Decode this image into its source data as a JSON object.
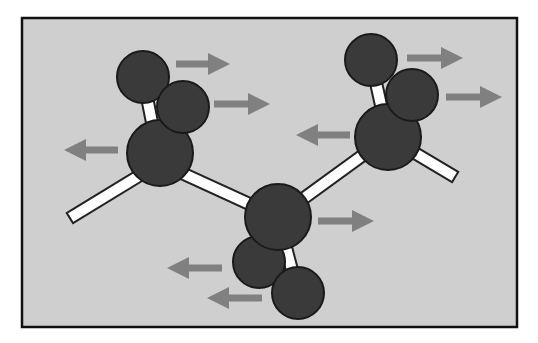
{
  "diagram": {
    "type": "ball-and-stick molecule with motion arrows",
    "colors": {
      "page_background": "#ffffff",
      "panel_background": "#cfcfcf",
      "panel_border": "#111111",
      "atom_fill": "#3a3a3a",
      "atom_stroke": "#1a1a1a",
      "bond_fill": "#ffffff",
      "bond_stroke": "#222222",
      "arrow_color": "#808080"
    },
    "frame": {
      "x": 22,
      "y": 18,
      "width": 495,
      "height": 309
    },
    "bonds": [
      {
        "x1": 75,
        "y1": 215,
        "x2": 160,
        "y2": 163
      },
      {
        "x1": 160,
        "y1": 163,
        "x2": 278,
        "y2": 217
      },
      {
        "x1": 278,
        "y1": 217,
        "x2": 388,
        "y2": 137
      },
      {
        "x1": 388,
        "y1": 137,
        "x2": 450,
        "y2": 174
      },
      {
        "x1": 160,
        "y1": 163,
        "x2": 143,
        "y2": 77
      },
      {
        "x1": 160,
        "y1": 163,
        "x2": 183,
        "y2": 107
      },
      {
        "x1": 388,
        "y1": 137,
        "x2": 371,
        "y2": 60
      },
      {
        "x1": 388,
        "y1": 137,
        "x2": 412,
        "y2": 95
      },
      {
        "x1": 278,
        "y1": 217,
        "x2": 298,
        "y2": 293
      },
      {
        "x1": 278,
        "y1": 217,
        "x2": 259,
        "y2": 262
      }
    ],
    "atoms": [
      {
        "name": "hydrogen-top-left-a",
        "cx": 143,
        "cy": 77,
        "r": 26
      },
      {
        "name": "hydrogen-top-right-a",
        "cx": 371,
        "cy": 60,
        "r": 26
      },
      {
        "name": "hydrogen-bottom-a",
        "cx": 259,
        "cy": 262,
        "r": 26
      },
      {
        "name": "carbon-left",
        "cx": 160,
        "cy": 153,
        "r": 33
      },
      {
        "name": "carbon-right",
        "cx": 388,
        "cy": 137,
        "r": 33
      },
      {
        "name": "carbon-center",
        "cx": 278,
        "cy": 217,
        "r": 33
      },
      {
        "name": "hydrogen-top-left-b",
        "cx": 183,
        "cy": 107,
        "r": 26
      },
      {
        "name": "hydrogen-top-right-b",
        "cx": 412,
        "cy": 95,
        "r": 26
      },
      {
        "name": "hydrogen-bottom-b",
        "cx": 298,
        "cy": 293,
        "r": 26
      }
    ],
    "arrows": [
      {
        "name": "arrow-right-1",
        "x1": 176,
        "x2": 230,
        "y": 64,
        "direction": "right"
      },
      {
        "name": "arrow-right-2",
        "x1": 214,
        "x2": 270,
        "y": 104,
        "direction": "right"
      },
      {
        "name": "arrow-left-1",
        "x1": 118,
        "x2": 64,
        "y": 150,
        "direction": "left"
      },
      {
        "name": "arrow-right-3",
        "x1": 407,
        "x2": 463,
        "y": 58,
        "direction": "right"
      },
      {
        "name": "arrow-right-4",
        "x1": 446,
        "x2": 502,
        "y": 97,
        "direction": "right"
      },
      {
        "name": "arrow-left-2",
        "x1": 350,
        "x2": 296,
        "y": 135,
        "direction": "left"
      },
      {
        "name": "arrow-right-5",
        "x1": 318,
        "x2": 374,
        "y": 221,
        "direction": "right"
      },
      {
        "name": "arrow-left-3",
        "x1": 222,
        "x2": 167,
        "y": 268,
        "direction": "left"
      },
      {
        "name": "arrow-left-4",
        "x1": 262,
        "x2": 207,
        "y": 298,
        "direction": "left"
      }
    ]
  }
}
